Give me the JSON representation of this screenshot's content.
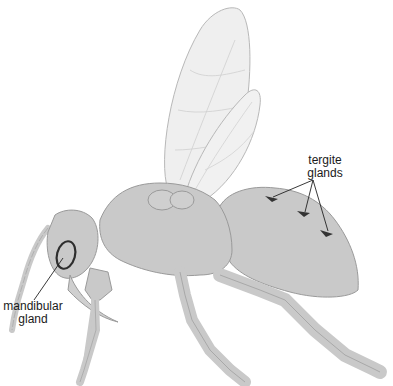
{
  "diagram": {
    "labels": {
      "tergite_line1": "tergite",
      "tergite_line2": "glands",
      "mandibular_line1": "mandibular",
      "mandibular_line2": "gland"
    },
    "colors": {
      "body_fill": "#c9c9c9",
      "body_stroke": "#9a9a9a",
      "wing_fill": "#eeeeee",
      "wing_stroke": "#b5b5b5",
      "gland_mark": "#333333",
      "pointer_line": "#222222"
    }
  }
}
